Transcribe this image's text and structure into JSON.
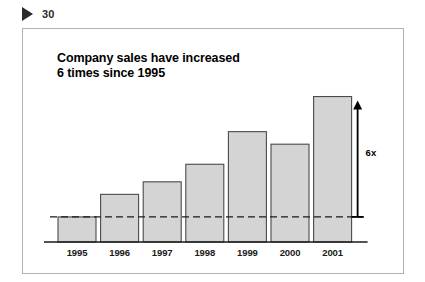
{
  "header": {
    "marker_icon": "play-triangle-icon",
    "slide_number": "30"
  },
  "slide": {
    "title_line1": "Company sales have increased",
    "title_line2": "6 times since 1995"
  },
  "annotation": {
    "growth_label": "6x",
    "arrow_icon": "up-arrow-icon",
    "baseline_icon": "dashed-reference-line"
  },
  "colors": {
    "bar_fill": "#d4d4d4",
    "bar_stroke": "#4a4a4a",
    "axis": "#1a1a1a",
    "frame": "#b0b0b0",
    "text": "#000000"
  },
  "chart_data": {
    "type": "bar",
    "title": "Company sales have increased 6 times since 1995",
    "xlabel": "",
    "ylabel": "",
    "categories": [
      "1995",
      "1996",
      "1997",
      "1998",
      "1999",
      "2000",
      "2001"
    ],
    "values": [
      1.0,
      1.9,
      2.4,
      3.1,
      4.4,
      3.9,
      5.8
    ],
    "ylim": [
      0,
      6.3
    ],
    "grid": false,
    "legend": false,
    "reference_line": {
      "label": "1995 baseline",
      "value": 1.0,
      "style": "dashed"
    },
    "annotations": [
      {
        "text": "6x",
        "type": "arrow",
        "from_value": 1.0,
        "to_value": 5.8,
        "note": "growth from 1995 baseline to 2001"
      }
    ]
  }
}
